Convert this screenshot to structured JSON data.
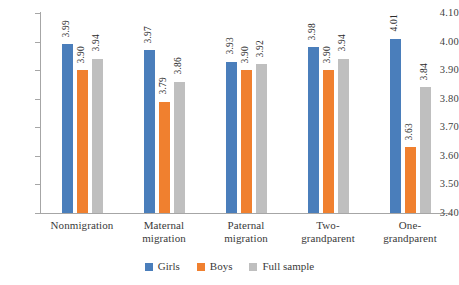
{
  "chart_data": {
    "type": "bar",
    "title": "",
    "subtitle": "",
    "xlabel": "",
    "ylabel": "",
    "ylim": [
      3.4,
      4.1
    ],
    "ytick_step": 0.1,
    "yticks": [
      "4.10",
      "4.00",
      "3.90",
      "3.80",
      "3.70",
      "3.60",
      "3.50",
      "3.40"
    ],
    "grid": false,
    "legend_position": "bottom",
    "categories": [
      "Nonmigration",
      "Maternal migration",
      "Paternal migration",
      "Two-grandparent",
      "One-grandparent"
    ],
    "category_lines": [
      [
        "Nonmigration"
      ],
      [
        "Maternal",
        "migration"
      ],
      [
        "Paternal",
        "migration"
      ],
      [
        "Two-",
        "grandparent"
      ],
      [
        "One-",
        "grandparent"
      ]
    ],
    "series": [
      {
        "name": "Girls",
        "color": "#4a7ebb",
        "values": [
          3.99,
          3.97,
          3.93,
          3.98,
          4.01
        ],
        "labels": [
          "3.99",
          "3.97",
          "3.93",
          "3.98",
          "4.01"
        ]
      },
      {
        "name": "Boys",
        "color": "#f0802f",
        "values": [
          3.9,
          3.79,
          3.9,
          3.9,
          3.63
        ],
        "labels": [
          "3.90",
          "3.79",
          "3.90",
          "3.90",
          "3.63"
        ]
      },
      {
        "name": "Full sample",
        "color": "#bfbfbf",
        "values": [
          3.94,
          3.86,
          3.92,
          3.94,
          3.84
        ],
        "labels": [
          "3.94",
          "3.86",
          "3.92",
          "3.94",
          "3.84"
        ]
      }
    ]
  },
  "legend": {
    "items": [
      {
        "label": "Girls",
        "color": "#4a7ebb"
      },
      {
        "label": "Boys",
        "color": "#f0802f"
      },
      {
        "label": "Full sample",
        "color": "#bfbfbf"
      }
    ]
  },
  "colors": {
    "girls": "#4a7ebb",
    "boys": "#f0802f",
    "full_sample": "#bfbfbf",
    "axis": "#a6a6a6",
    "text": "#3a3a3a",
    "background": "#ffffff"
  }
}
